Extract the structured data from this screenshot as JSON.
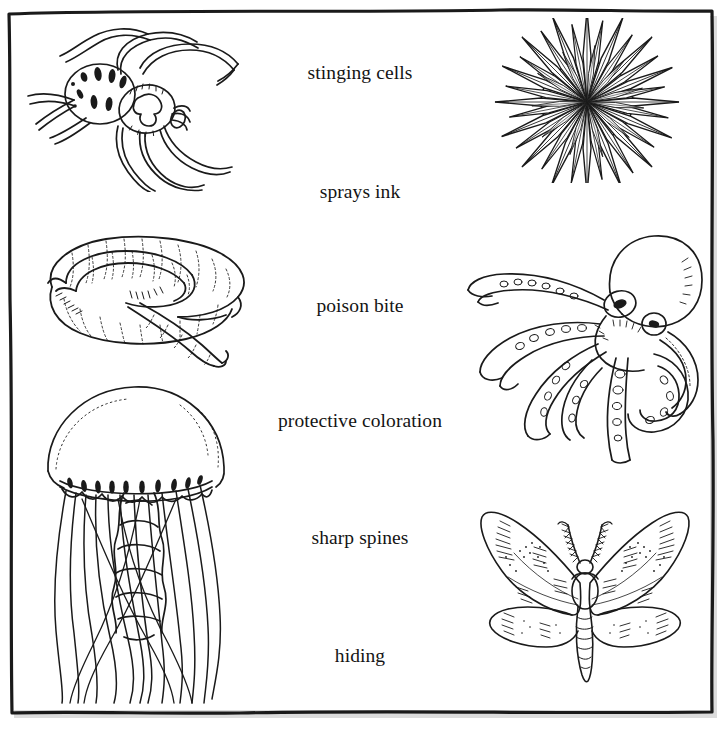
{
  "worksheet": {
    "kind": "matching-worksheet",
    "frame": {
      "style": "hand-drawn-rectangle",
      "line_color": "#1a1a1a",
      "shadow_color": "#c9c9c9"
    },
    "ink_color": "#141414"
  },
  "labels": [
    {
      "id": "stinging-cells",
      "text": "stinging cells",
      "top": 62
    },
    {
      "id": "sprays-ink",
      "text": "sprays ink",
      "top": 181
    },
    {
      "id": "poison-bite",
      "text": "poison bite",
      "top": 295
    },
    {
      "id": "protective-coloration",
      "text": "protective coloration",
      "top": 410
    },
    {
      "id": "sharp-spines",
      "text": "sharp spines",
      "top": 527
    },
    {
      "id": "hiding",
      "text": "hiding",
      "top": 645
    }
  ],
  "figures_left": [
    {
      "id": "spider",
      "name": "spider-illustration",
      "alt": "spider"
    },
    {
      "id": "earthworm",
      "name": "earthworm-illustration",
      "alt": "earthworm"
    },
    {
      "id": "jellyfish",
      "name": "jellyfish-illustration",
      "alt": "jellyfish"
    }
  ],
  "figures_right": [
    {
      "id": "sea-urchin",
      "name": "sea-urchin-illustration",
      "alt": "sea urchin"
    },
    {
      "id": "octopus",
      "name": "octopus-illustration",
      "alt": "octopus"
    },
    {
      "id": "moth",
      "name": "moth-illustration",
      "alt": "moth"
    }
  ]
}
